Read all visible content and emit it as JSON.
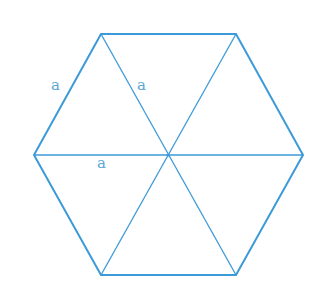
{
  "diagram": {
    "colors": {
      "stroke": "#3c9ad8",
      "label": "#5aa7d6",
      "background": "#ffffff"
    },
    "labels": [
      {
        "text": "a",
        "meaning": "outer side length"
      },
      {
        "text": "a",
        "meaning": "radius to upper-left vertex"
      },
      {
        "text": "a",
        "meaning": "radius to left vertex"
      }
    ]
  }
}
